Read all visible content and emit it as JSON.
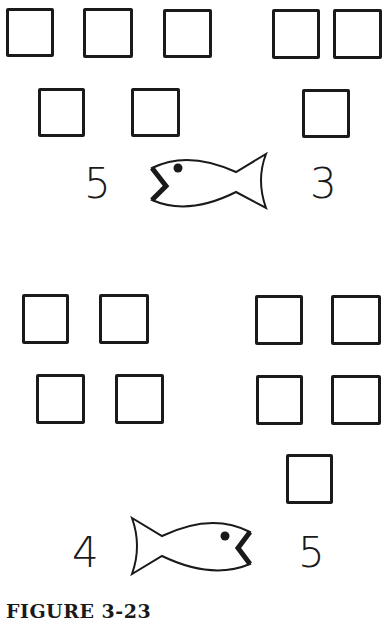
{
  "figure": {
    "caption": "FIGURE 3-23"
  },
  "panels": [
    {
      "left_number": "5",
      "right_number": "3",
      "fish_mouth_faces": "left",
      "left_group_count": 5,
      "right_group_count": 3
    },
    {
      "left_number": "4",
      "right_number": "5",
      "fish_mouth_faces": "right",
      "left_group_count": 4,
      "right_group_count": 5
    }
  ]
}
